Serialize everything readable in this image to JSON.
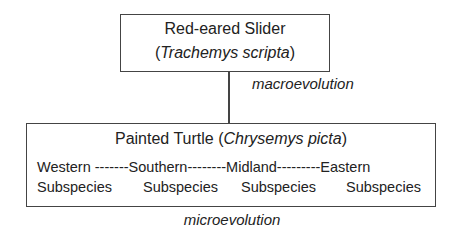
{
  "top_node": {
    "common_name": "Red-eared Slider",
    "open_paren": "(",
    "scientific_name": "Trachemys scripta",
    "close_paren": ")"
  },
  "connector_label": "macroevolution",
  "bottom_node": {
    "common_name": "Painted Turtle (",
    "scientific_name": "Chrysemys picta",
    "close_paren": ")",
    "subspecies": [
      {
        "name": "Western",
        "label": "Subspecies"
      },
      {
        "name": "Southern",
        "label": "Subspecies"
      },
      {
        "name": "Midland",
        "label": "Subspecies"
      },
      {
        "name": "Eastern",
        "label": "Subspecies"
      }
    ],
    "separators": [
      " -------",
      "--------",
      "---------"
    ]
  },
  "footer_label": "microevolution",
  "colors": {
    "line": "#444444",
    "text": "#222222",
    "background": "#ffffff"
  }
}
